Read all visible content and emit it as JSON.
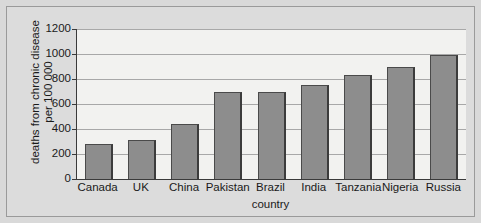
{
  "chart_data": {
    "type": "bar",
    "title": "",
    "xlabel": "country",
    "ylabel_lines": [
      "deaths from chronic disease",
      "per 100 000"
    ],
    "ylabel": "deaths from chronic disease per 100 000",
    "categories": [
      "Canada",
      "UK",
      "China",
      "Pakistan",
      "Brazil",
      "India",
      "Tanzania",
      "Nigeria",
      "Russia"
    ],
    "values": [
      280,
      310,
      440,
      700,
      700,
      750,
      830,
      895,
      995
    ],
    "ylim": [
      0,
      1200
    ],
    "ytick_labels": [
      "0",
      "200",
      "400",
      "600",
      "800",
      "1000",
      "1200"
    ],
    "ytick_values": [
      0,
      200,
      400,
      600,
      800,
      1000,
      1200
    ],
    "grid": true,
    "legend": "none",
    "series": [
      {
        "name": "deaths from chronic disease per 100 000",
        "values": [
          280,
          310,
          440,
          700,
          700,
          750,
          830,
          895,
          995
        ]
      }
    ]
  },
  "style": {
    "bar_fill": "#8d8d8d",
    "bar_edge": "#3c3c3c",
    "plot_background": "#f2f2f0",
    "page_background": "#dcdcdc",
    "axis_color": "#3a3a3a",
    "grid_color": "#a8a8a8",
    "text_color": "#1a1a1a"
  }
}
